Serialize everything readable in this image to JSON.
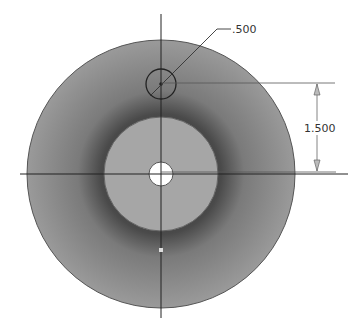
{
  "drawing": {
    "type": "cad-sketch",
    "center": [
      161,
      174
    ],
    "outer_circle": {
      "radius": 134,
      "fill": "#8e8e8e",
      "stroke": "#555555"
    },
    "inner_disk": {
      "radius": 57,
      "fill": "#a5a5a5",
      "stroke": "#666666"
    },
    "center_hole": {
      "radius": 12,
      "fill": "#ffffff"
    },
    "offset_hole": {
      "center": [
        161,
        84
      ],
      "radius": 15,
      "stroke": "#222222"
    },
    "colors": {
      "line": "#222222",
      "dim": "#666666",
      "shadow": "#3a3a3a"
    }
  },
  "dimensions": {
    "diameter_label": ".500",
    "distance_label": "1.500"
  }
}
